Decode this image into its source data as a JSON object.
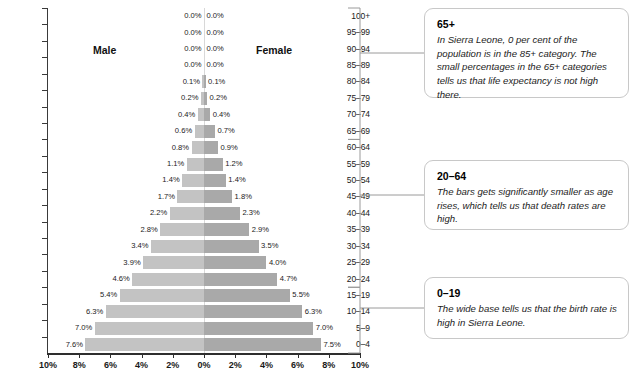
{
  "chart_data": {
    "type": "bar",
    "subtype": "population-pyramid",
    "title": "",
    "xlabel": "",
    "ylabel": "",
    "grid": false,
    "legend_position": "inline-top",
    "xlim": [
      -10,
      10
    ],
    "x_tick_labels": [
      "10%",
      "8%",
      "6%",
      "4%",
      "2%",
      "0%",
      "2%",
      "4%",
      "6%",
      "8%",
      "10%"
    ],
    "x_tick_values": [
      -10,
      -8,
      -6,
      -4,
      -2,
      0,
      2,
      4,
      6,
      8,
      10
    ],
    "categories": [
      "100+",
      "95–99",
      "90–94",
      "85–89",
      "80–84",
      "75–79",
      "70–74",
      "65–69",
      "60–64",
      "55–59",
      "50–54",
      "45–49",
      "40–44",
      "35–39",
      "30–34",
      "25–29",
      "20–24",
      "15–19",
      "10–14",
      "5–9",
      "0–4"
    ],
    "series": [
      {
        "name": "Male",
        "side": "left",
        "color": "#c3c3c3",
        "values": [
          0.0,
          0.0,
          0.0,
          0.0,
          0.1,
          0.2,
          0.4,
          0.6,
          0.8,
          1.1,
          1.4,
          1.7,
          2.2,
          2.8,
          3.4,
          3.9,
          4.6,
          5.4,
          6.3,
          7.0,
          7.6
        ],
        "labels": [
          "0.0%",
          "0.0%",
          "0.0%",
          "0.0%",
          "0.1%",
          "0.2%",
          "0.4%",
          "0.6%",
          "0.8%",
          "1.1%",
          "1.4%",
          "1.7%",
          "2.2%",
          "2.8%",
          "3.4%",
          "3.9%",
          "4.6%",
          "5.4%",
          "6.3%",
          "7.0%",
          "7.6%"
        ]
      },
      {
        "name": "Female",
        "side": "right",
        "color": "#a9a9a9",
        "values": [
          0.0,
          0.0,
          0.0,
          0.0,
          0.1,
          0.2,
          0.4,
          0.7,
          0.9,
          1.2,
          1.4,
          1.8,
          2.3,
          2.9,
          3.5,
          4.0,
          4.7,
          5.5,
          6.3,
          7.0,
          7.5
        ],
        "labels": [
          "0.0%",
          "0.0%",
          "0.0%",
          "0.0%",
          "0.1%",
          "0.2%",
          "0.4%",
          "0.7%",
          "0.9%",
          "1.2%",
          "1.4%",
          "1.8%",
          "2.3%",
          "2.9%",
          "3.5%",
          "4.0%",
          "4.7%",
          "5.5%",
          "6.3%",
          "7.0%",
          "7.5%"
        ]
      }
    ],
    "annotations": [
      {
        "title": "65+",
        "body": "In Sierra Leone, 0 per cent of the population is in the 85+ category. The small percentages in the 65+ categories tells us that life expectancy is not high there.",
        "bracket_categories": [
          "100+",
          "65–69"
        ]
      },
      {
        "title": "20–64",
        "body": "The bars gets significantly smaller as age rises, which tells us that death rates are high.",
        "bracket_categories": [
          "60–64",
          "20–24"
        ]
      },
      {
        "title": "0–19",
        "body": "The wide base tells us that the birth rate is high in Sierra Leone.",
        "bracket_categories": [
          "15–19",
          "0–4"
        ]
      }
    ]
  },
  "chart": {
    "male_title": "Male",
    "female_title": "Female"
  },
  "notes": [
    {
      "title": "65+",
      "body": "In Sierra Leone, 0 per cent of the population is in the 85+ category. The small percentages in the 65+ categories tells us that life expectancy is not high there."
    },
    {
      "title": "20–64",
      "body": "The bars gets significantly smaller as age rises, which tells us that death rates are high."
    },
    {
      "title": "0–19",
      "body": "The wide base tells us that the birth rate is high in Sierra Leone."
    }
  ],
  "colors": {
    "male_bar": "#c3c3c3",
    "female_bar": "#a9a9a9",
    "axis": "#2e2e2e",
    "card_border": "#c8c8c8"
  }
}
